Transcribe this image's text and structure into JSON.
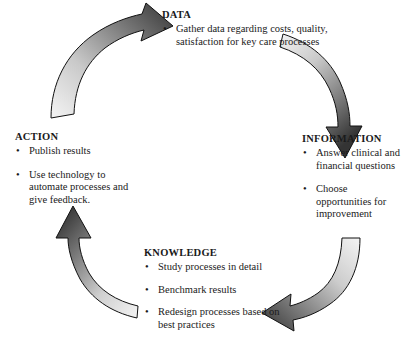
{
  "diagram": {
    "colors": {
      "arrow_light": "#f2f2f2",
      "arrow_mid": "#a8a8a8",
      "arrow_dark": "#3a3a3a",
      "arrow_outline": "#000000",
      "text": "#1a1a1a",
      "background": "#ffffff"
    },
    "bullet_glyph": "•",
    "stages": [
      {
        "id": "data",
        "title": "DATA",
        "bullets": [
          "Gather data regarding costs, quality, satisfaction for key care processes"
        ]
      },
      {
        "id": "information",
        "title": "INFORMATION",
        "bullets": [
          "Answer clinical and financial questions",
          "Choose opportunities for improvement"
        ]
      },
      {
        "id": "knowledge",
        "title": "KNOWLEDGE",
        "bullets": [
          "Study processes in detail",
          "Benchmark results",
          "Redesign processes based on best practices"
        ]
      },
      {
        "id": "action",
        "title": "ACTION",
        "bullets": [
          "Publish results",
          "Use technology to automate processes and give feedback."
        ]
      }
    ],
    "arrows": [
      {
        "id": "action-to-data",
        "from": "ACTION",
        "to": "DATA",
        "direction": "up-right"
      },
      {
        "id": "data-to-information",
        "from": "DATA",
        "to": "INFORMATION",
        "direction": "down-right"
      },
      {
        "id": "information-to-knowledge",
        "from": "INFORMATION",
        "to": "KNOWLEDGE",
        "direction": "down-left"
      },
      {
        "id": "knowledge-to-action",
        "from": "KNOWLEDGE",
        "to": "ACTION",
        "direction": "up-left"
      }
    ]
  }
}
